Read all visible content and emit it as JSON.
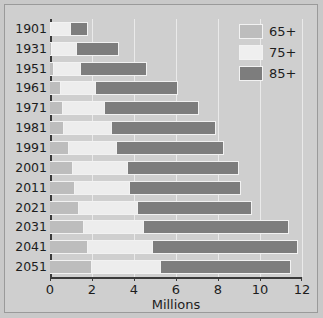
{
  "chart_data": {
    "type": "bar",
    "orientation": "horizontal",
    "stacked": true,
    "title": "",
    "xlabel": "Millions",
    "ylabel": "",
    "xlim": [
      0,
      12
    ],
    "xticks": [
      0,
      2,
      4,
      6,
      8,
      10,
      12
    ],
    "xticklabels": [
      "0",
      "2",
      "4",
      "6",
      "8",
      "10",
      "12"
    ],
    "grid": "vertical",
    "legend_position": "top-right",
    "categories": [
      "1901",
      "1931",
      "1951",
      "1961",
      "1971",
      "1981",
      "1991",
      "2001",
      "2011",
      "2021",
      "2031",
      "2041",
      "2051"
    ],
    "series": [
      {
        "name": "65+",
        "color": "#bdbdbd",
        "values": [
          0.05,
          0.1,
          0.2,
          0.5,
          0.6,
          0.65,
          0.9,
          1.1,
          1.2,
          1.4,
          1.6,
          1.8,
          2.0
        ]
      },
      {
        "name": "75+",
        "color": "#ededed",
        "values": [
          0.95,
          1.2,
          1.3,
          1.7,
          2.0,
          2.3,
          2.3,
          2.6,
          2.6,
          2.8,
          2.9,
          3.1,
          3.3
        ]
      },
      {
        "name": "85+",
        "color": "#7d7d7d",
        "values": [
          0.8,
          2.0,
          3.1,
          3.9,
          4.5,
          4.95,
          5.1,
          5.3,
          5.3,
          5.4,
          6.9,
          6.9,
          6.2
        ]
      }
    ],
    "totals": [
      1.8,
      3.3,
      4.6,
      6.1,
      7.1,
      7.9,
      8.3,
      9.0,
      9.1,
      9.6,
      11.4,
      11.8,
      11.5
    ],
    "legend_entries": [
      "65+",
      "75+",
      "85+"
    ],
    "colors": {
      "series_65": "#bdbdbd",
      "series_75": "#ededed",
      "series_85": "#7d7d7d",
      "background": "#cfcfcf",
      "axis": "#3a3a3a",
      "gridline": "#eaeaea",
      "text": "#1d1d1d"
    }
  }
}
